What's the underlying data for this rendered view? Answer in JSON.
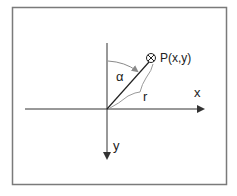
{
  "diagram": {
    "labels": {
      "point": "P(x,y)",
      "x_axis": "x",
      "y_axis": "y",
      "angle": "α",
      "radius": "r"
    },
    "colors": {
      "frame": "#7a7a7a",
      "axes": "#333333",
      "angle_arc": "#8a8a8a",
      "brace": "#9a9a9a"
    }
  }
}
